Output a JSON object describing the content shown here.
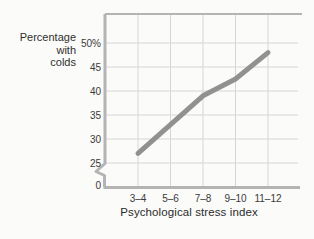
{
  "figure": {
    "ylabel": "Percentage\nwith\ncolds",
    "xlabel": "Psychological stress index"
  },
  "chart_data": {
    "type": "line",
    "title": "",
    "xlabel": "Psychological stress index",
    "ylabel": "Percentage with colds",
    "categories": [
      "3–4",
      "5–6",
      "7–8",
      "9–10",
      "11–12"
    ],
    "series": [
      {
        "name": "Percentage with colds",
        "values": [
          27,
          33,
          39,
          42.5,
          48
        ]
      }
    ],
    "yticks": [
      0,
      25,
      30,
      35,
      40,
      45,
      50
    ],
    "ytick_labels": [
      "0",
      "25",
      "30",
      "35",
      "40",
      "45",
      "50%"
    ],
    "ylim_display": [
      25,
      50
    ],
    "axis_break_between": [
      0,
      25
    ],
    "grid": true,
    "legend_position": "none",
    "colors": {
      "line": "#919191",
      "grid": "#d6d6d6",
      "axis": "#b4b4b4",
      "text": "#3a3a3a",
      "background": "#fbfbf9"
    }
  }
}
